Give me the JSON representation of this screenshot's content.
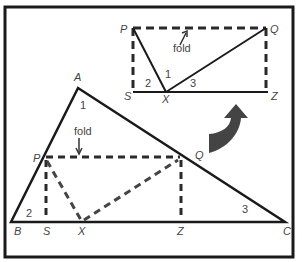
{
  "figure": {
    "colors": {
      "stroke": "#1a1a1a",
      "dashed": "#2a2a2a",
      "arrow": "#444444",
      "text": "#444444"
    },
    "top_diagram": {
      "vertices": {
        "P": "P",
        "Q": "Q",
        "S": "S",
        "X": "X",
        "Z": "Z"
      },
      "angles": {
        "a1": "1",
        "a2": "2",
        "a3": "3"
      },
      "fold_label": "fold"
    },
    "main_triangle": {
      "vertices": {
        "A": "A",
        "B": "B",
        "C": "C",
        "P": "P",
        "Q": "Q",
        "S": "S",
        "X": "X",
        "Z": "Z"
      },
      "angles": {
        "a1": "1",
        "a2": "2",
        "a3": "3"
      },
      "fold_label": "fold"
    },
    "arrow": "curved-up-arrow"
  }
}
